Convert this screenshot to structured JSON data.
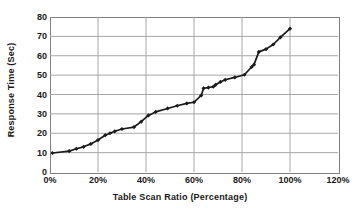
{
  "chart_data": {
    "type": "line",
    "title": "",
    "xlabel": "Table Scan Ratio (Percentage)",
    "ylabel": "Response Time (Sec)",
    "xlim": [
      0,
      120
    ],
    "ylim": [
      0,
      80
    ],
    "xticks": [
      "0%",
      "20%",
      "40%",
      "60%",
      "80%",
      "100%",
      "120%"
    ],
    "xtick_values": [
      0,
      20,
      40,
      60,
      80,
      100,
      120
    ],
    "yticks": [
      "0",
      "10",
      "20",
      "30",
      "40",
      "50",
      "60",
      "70",
      "80"
    ],
    "ytick_values": [
      0,
      10,
      20,
      30,
      40,
      50,
      60,
      70,
      80
    ],
    "grid": "horizontal-and-vertical",
    "legend": "none",
    "marker": "diamond",
    "line_color": "#1a1a1a",
    "grid_color": "#a6a6a6",
    "axis_color": "#808080",
    "series": [
      {
        "name": "Response Time",
        "x": [
          1,
          8,
          11,
          14,
          17,
          20,
          23,
          25,
          27,
          30,
          35,
          38,
          41,
          44,
          49,
          53,
          57,
          60,
          63,
          64,
          66,
          68,
          69,
          71,
          73,
          77,
          81,
          84,
          85,
          87,
          90,
          93,
          96,
          100
        ],
        "y": [
          9.8,
          10.8,
          12.0,
          13.0,
          14.5,
          16.5,
          19.0,
          20.0,
          21.0,
          22.2,
          23.2,
          26.0,
          29.2,
          31.0,
          32.8,
          34.2,
          35.4,
          36.0,
          39.5,
          43.2,
          43.6,
          44.0,
          45.0,
          46.5,
          47.6,
          48.8,
          50.2,
          54.2,
          55.4,
          62.0,
          63.4,
          65.8,
          69.5,
          74.0
        ]
      }
    ]
  },
  "axis_titles": {
    "x": "Table Scan Ratio (Percentage)",
    "y": "Response Time (Sec)"
  }
}
